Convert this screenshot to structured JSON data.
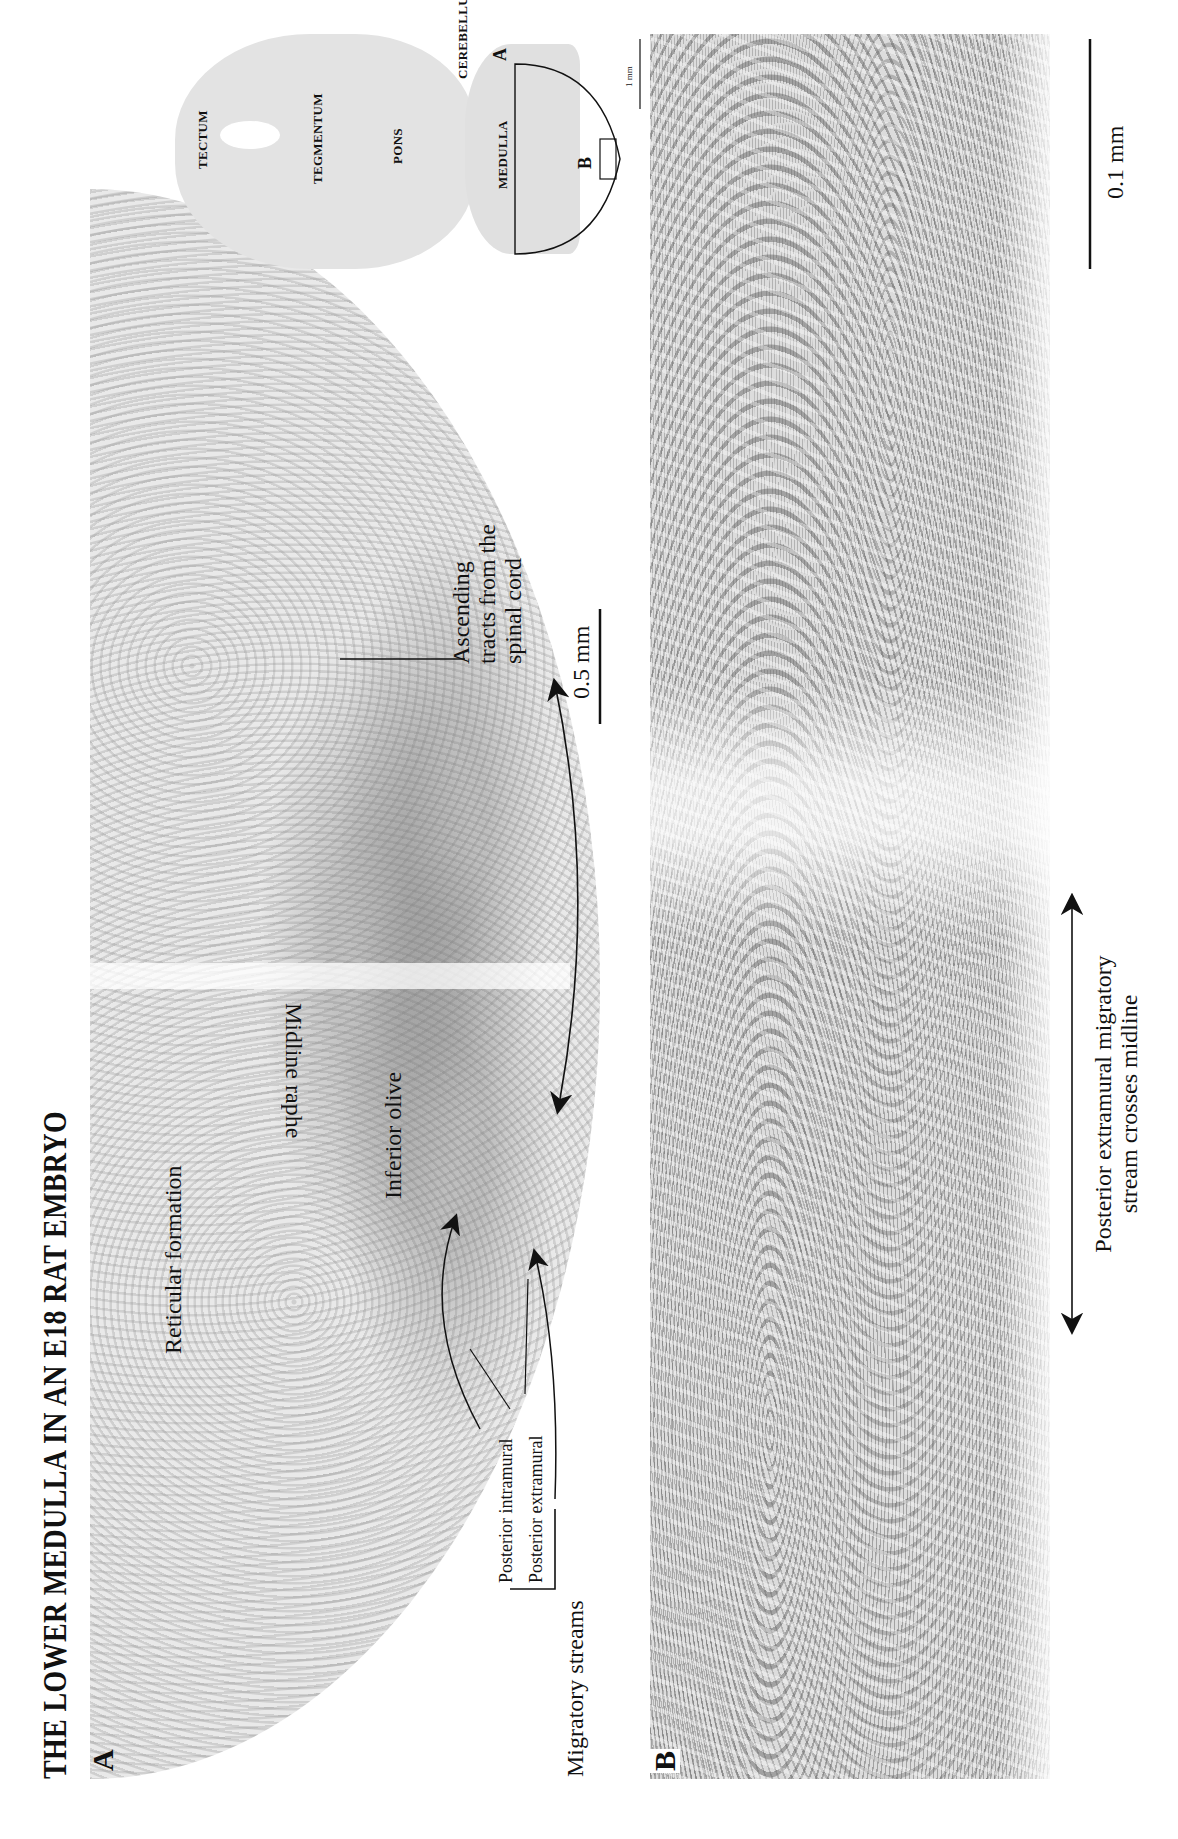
{
  "figure": {
    "title": "THE LOWER MEDULLA IN AN E18 RAT EMBRYO",
    "orientation": "rotated 90° counter-clockwise on page"
  },
  "panel_a": {
    "letter": "A",
    "labels": {
      "reticular_formation": "Reticular formation",
      "midline_raphe": "Midline raphe",
      "inferior_olive": "Inferior olive",
      "ascending_tracts_line1": "Ascending",
      "ascending_tracts_line2": "tracts from the",
      "ascending_tracts_line3": "spinal cord",
      "posterior_intramural": "Posterior intramural",
      "posterior_extramural": "Posterior extramural",
      "migratory_streams": "Migratory streams"
    },
    "scale_bar": "0.5 mm"
  },
  "inset": {
    "labels": {
      "tectum": "TECTUM",
      "tegmentum": "TEGMENTUM",
      "pons": "PONS",
      "cerebellum": "CEREBELLUM",
      "medulla": "MEDULLA"
    },
    "region_a": "A",
    "region_b": "B",
    "scale_bar": "1 mm"
  },
  "panel_b": {
    "letter": "B",
    "annotation_line1": "Posterior extramural migratory",
    "annotation_line2": "stream crosses midline",
    "scale_bar": "0.1 mm"
  }
}
